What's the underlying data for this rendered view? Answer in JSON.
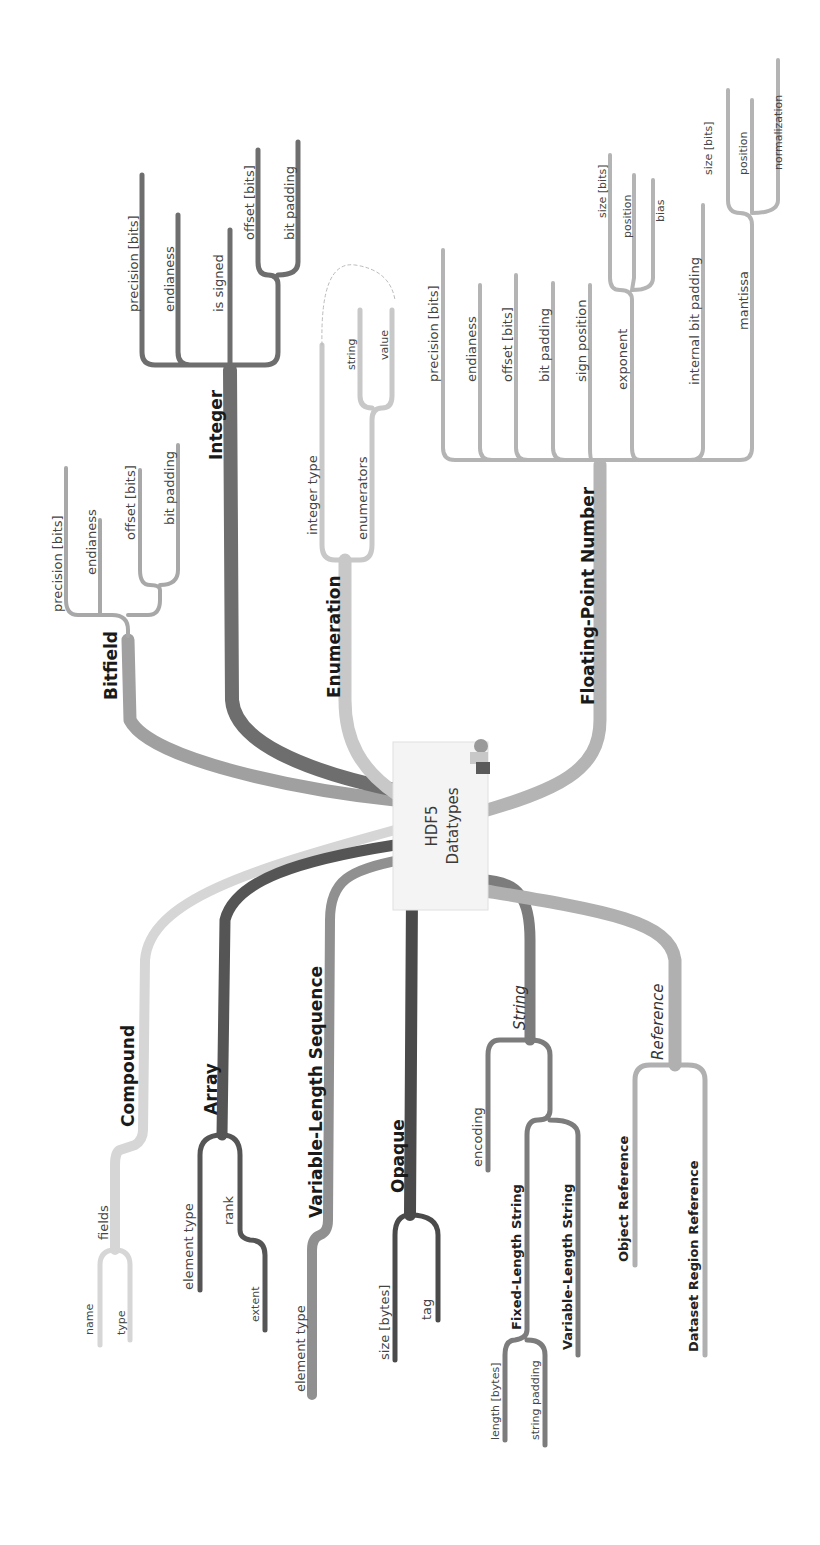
{
  "center": {
    "line1": "HDF5",
    "line2": "Datatypes",
    "icon": "person-at-desk-icon"
  },
  "colors": {
    "bitfield": "#a0a0a0",
    "integer": "#6e6e6e",
    "enumeration": "#c8c8c8",
    "floating_point": "#b4b4b4",
    "compound": "#d6d6d6",
    "array": "#555555",
    "vlen": "#909090",
    "opaque": "#4a4a4a",
    "string": "#7c7c7c",
    "reference": "#b0b0b0"
  },
  "branches": {
    "bitfield": {
      "label": "Bitfield",
      "children": [
        "precision [bits]",
        "endianess",
        "offset [bits]",
        "bit padding"
      ]
    },
    "integer": {
      "label": "Integer",
      "children": [
        "precision [bits]",
        "endianess",
        "is signed",
        "offset [bits]",
        "bit padding"
      ]
    },
    "enumeration": {
      "label": "Enumeration",
      "children": [
        "integer type",
        "enumerators"
      ],
      "enumerators_children": [
        "string",
        "value"
      ]
    },
    "floating_point": {
      "label": "Floating-Point Number",
      "children": [
        "precision [bits]",
        "endianess",
        "offset [bits]",
        "bit padding",
        "sign position",
        "exponent",
        "internal bit padding",
        "mantissa"
      ],
      "exponent_children": [
        "size [bits]",
        "position",
        "bias"
      ],
      "mantissa_children": [
        "size [bits]",
        "position",
        "normalization"
      ]
    },
    "compound": {
      "label": "Compound",
      "children": [
        "fields"
      ],
      "fields_children": [
        "name",
        "type"
      ]
    },
    "array": {
      "label": "Array",
      "children": [
        "element type",
        "rank"
      ],
      "rank_children": [
        "extent"
      ]
    },
    "vlen": {
      "label": "Variable-Length Sequence",
      "children": [
        "element type"
      ]
    },
    "opaque": {
      "label": "Opaque",
      "children": [
        "size [bytes]",
        "tag"
      ]
    },
    "string": {
      "label": "String",
      "children": [
        "encoding",
        "Fixed-Length String",
        "Variable-Length String"
      ],
      "fixed_children": [
        "length [bytes]",
        "string padding"
      ]
    },
    "reference": {
      "label": "Reference",
      "children": [
        "Object Reference",
        "Dataset Region Reference"
      ]
    }
  }
}
